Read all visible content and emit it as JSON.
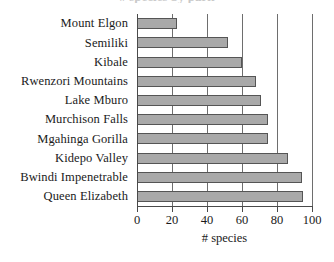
{
  "chart_data": {
    "type": "bar",
    "orientation": "horizontal",
    "title": "",
    "xlabel": "# species",
    "ylabel": "",
    "categories": [
      "Mount Elgon",
      "Semiliki",
      "Kibale",
      "Rwenzori Mountains",
      "Lake Mburo",
      "Murchison Falls",
      "Mgahinga Gorilla",
      "Kidepo Valley",
      "Bwindi Impenetrable",
      "Queen Elizabeth"
    ],
    "values": [
      23,
      52,
      60,
      68,
      71,
      75,
      75,
      86,
      94,
      95
    ],
    "xlim": [
      0,
      100
    ],
    "xticks": [
      0,
      20,
      40,
      60,
      80,
      100
    ],
    "xtick_labels": [
      "0",
      "20",
      "40",
      "60",
      "80",
      "100"
    ],
    "grid": true,
    "grid_axis": "x",
    "legend": false,
    "bar_fill_color": "#a9a9a9",
    "bar_edge_color": "#555555",
    "gridline_color": "#6e6e6e",
    "axis_color": "#4a4a4a"
  },
  "clipped_title_remnant": "# species by park"
}
